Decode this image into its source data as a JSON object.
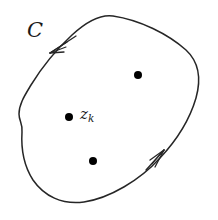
{
  "figure": {
    "background_color": "#ffffff",
    "stroke_color": "#262626",
    "point_color": "#000000",
    "width": 218,
    "height": 220
  },
  "labels": {
    "contour_name": "C",
    "pole_symbol": "z",
    "pole_subscript": "k"
  },
  "chart_data": {
    "type": "scatter",
    "xlabel": "",
    "ylabel": "",
    "xlim": [
      0,
      218
    ],
    "ylim": [
      0,
      220
    ],
    "grid": false,
    "legend": null,
    "annotations": [
      {
        "name": "contour-label",
        "text": "C",
        "x": 37,
        "y": 31
      },
      {
        "name": "pole-label",
        "text": "z_k",
        "x": 88,
        "y": 117
      }
    ],
    "series": [
      {
        "name": "singular-points",
        "marker": "filled-circle",
        "marker_size": 6,
        "color": "#000000",
        "points": [
          {
            "label": "z_k",
            "x": 69,
            "y": 117
          },
          {
            "label": "",
            "x": 138,
            "y": 75
          },
          {
            "label": "",
            "x": 93,
            "y": 161
          }
        ]
      }
    ],
    "curves": [
      {
        "name": "contour-c",
        "closed": true,
        "orientation": "counterclockwise",
        "color": "#262626",
        "linewidth": 1.5,
        "path": "M 113 16 C 140 20 168 34 186 50 C 200 63 201 80 196 98 C 189 122 175 142 160 158 C 140 180 110 198 84 202 C 62 205 44 196 33 180 C 24 166 21 148 22 132 C 23 124 19 121 19 114 C 19 104 25 95 31 85 C 42 67 58 48 72 35 C 85 23 99 14 113 16 Z"
      }
    ],
    "arrows": [
      {
        "name": "arrow-upper-left",
        "tip_x": 50,
        "tip_y": 53,
        "direction_deg": 218,
        "meaning": "counterclockwise traversal"
      },
      {
        "name": "arrow-lower-right",
        "tip_x": 164,
        "tip_y": 150,
        "direction_deg": 318,
        "meaning": "counterclockwise traversal"
      }
    ]
  }
}
